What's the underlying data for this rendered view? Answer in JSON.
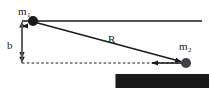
{
  "figure": {
    "width": 209,
    "height": 88,
    "background_color": "#ffffff",
    "ink_color": "#1a1a1a"
  },
  "labels": {
    "mass1": {
      "base": "m",
      "sub": "1",
      "full": "m1"
    },
    "mass2": {
      "base": "m",
      "sub": "2",
      "full": "m2"
    },
    "impact_parameter": {
      "base": "b",
      "full": "b"
    },
    "separation_vector": {
      "base": "R",
      "full": "R",
      "has_vector_arrow": true
    },
    "relative_velocity": {
      "base": "v",
      "sub": "rel",
      "full": "v_rel",
      "has_vector_arrow": true
    }
  },
  "geometry": {
    "top_line": {
      "x1": 22,
      "y1": 21,
      "x2": 202,
      "y2": 21,
      "style": "solid"
    },
    "dashed_line": {
      "x1": 22,
      "y1": 63,
      "x2": 186,
      "y2": 63,
      "style": "dashed"
    },
    "impact_arrow": {
      "x": 22,
      "y1": 21,
      "y2": 63,
      "style": "double-headed"
    },
    "separation_arrow": {
      "x1": 33,
      "y1": 21,
      "x2": 186,
      "y2": 63,
      "style": "solid-arrow"
    },
    "velocity_arrow": {
      "x1": 186,
      "y1": 63,
      "x2": 148,
      "y2": 63,
      "style": "solid-arrow-left"
    },
    "mass1_dot": {
      "cx": 33,
      "cy": 21,
      "r": 5
    },
    "mass2_dot": {
      "cx": 186,
      "cy": 63,
      "r": 5
    }
  }
}
